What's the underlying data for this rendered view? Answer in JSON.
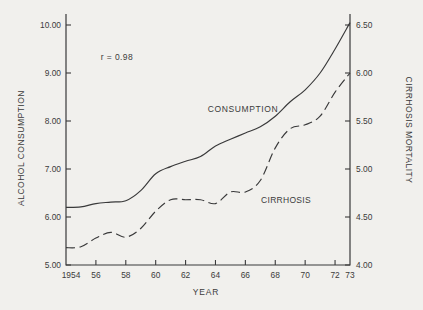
{
  "figure": {
    "annotation": "r = 0.98",
    "x_axis_title": "YEAR",
    "left_axis_title": "ALCOHOL CONSUMPTION",
    "right_axis_title": "CIRRHOSIS MORTALITY",
    "consumption_curve_label": "CONSUMPTION",
    "cirrhosis_curve_label": "CIRRHOSIS"
  },
  "colors": {
    "background": "#f1f0ed",
    "line": "#39393a",
    "text": "#3b3b3b"
  },
  "chart_data": {
    "type": "line",
    "title": "",
    "annotation": "r = 0.98",
    "correlation": 0.98,
    "xlabel": "YEAR",
    "x": [
      1954,
      1955,
      1956,
      1957,
      1958,
      1959,
      1960,
      1961,
      1962,
      1963,
      1964,
      1965,
      1966,
      1967,
      1968,
      1969,
      1970,
      1971,
      1972,
      1973
    ],
    "x_ticks": {
      "years": [
        1954,
        1956,
        1958,
        1960,
        1962,
        1964,
        1966,
        1968,
        1970,
        1972,
        1973
      ],
      "labels": [
        "1954",
        "56",
        "58",
        "60",
        "62",
        "64",
        "66",
        "68",
        "70",
        "72",
        "73"
      ]
    },
    "series": [
      {
        "name": "CONSUMPTION",
        "axis": "left",
        "style": "solid",
        "values": [
          6.2,
          6.21,
          6.28,
          6.31,
          6.34,
          6.55,
          6.9,
          7.05,
          7.16,
          7.26,
          7.48,
          7.62,
          7.75,
          7.88,
          8.1,
          8.4,
          8.65,
          9.0,
          9.5,
          10.05
        ]
      },
      {
        "name": "CIRRHOSIS",
        "axis": "right",
        "style": "dashed",
        "values": [
          4.18,
          4.19,
          4.28,
          4.34,
          4.29,
          4.38,
          4.56,
          4.68,
          4.68,
          4.68,
          4.64,
          4.76,
          4.76,
          4.88,
          5.22,
          5.42,
          5.46,
          5.55,
          5.8,
          6.0
        ]
      }
    ],
    "left_axis": {
      "label": "ALCOHOL CONSUMPTION",
      "tick_labels": [
        "10.00",
        "9.00",
        "8.00",
        "7.00",
        "6.00",
        "5.00"
      ],
      "tick_values": [
        10,
        9,
        8,
        7,
        6,
        5
      ],
      "min": 5,
      "max": 10.2
    },
    "right_axis": {
      "label": "CIRRHOSIS MORTALITY",
      "tick_labels": [
        "6.50",
        "6.00",
        "5.50",
        "5.00",
        "4.50",
        "4.00"
      ],
      "tick_values": [
        6.5,
        6.0,
        5.5,
        5.0,
        4.5,
        4.0
      ],
      "min": 4,
      "max": 6.6
    },
    "layout": {
      "grid": false,
      "legend": "inline-curve-labels",
      "plot": {
        "left": 66,
        "right": 350,
        "top": 14,
        "bottom": 265
      },
      "left_px_per_unit": 48,
      "right_px_per_unit": 96,
      "tick_len": 5
    }
  }
}
